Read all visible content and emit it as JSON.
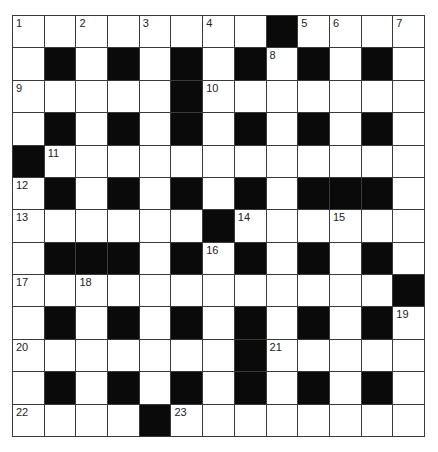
{
  "puzzle": {
    "type": "crossword",
    "rows": 13,
    "cols": 13,
    "colors": {
      "block": "#0a0a0a",
      "cell": "#ffffff",
      "line": "#3a3a3a",
      "number": "#222222"
    },
    "layout": [
      "........#....",
      ".#.#.#.#.#.#.",
      ".....#.......",
      ".#.#.#.#.#.#.",
      "#............",
      ".#.#.#.#.###.",
      "......#......",
      ".###.#.#.#.#.",
      "............#",
      ".#.#.#.#.#.#.",
      ".......#.....",
      ".#.#.#.#.#.#.",
      "....#........"
    ],
    "numbers": [
      {
        "row": 0,
        "col": 0,
        "label": "1"
      },
      {
        "row": 0,
        "col": 2,
        "label": "2"
      },
      {
        "row": 0,
        "col": 4,
        "label": "3"
      },
      {
        "row": 0,
        "col": 6,
        "label": "4"
      },
      {
        "row": 0,
        "col": 9,
        "label": "5"
      },
      {
        "row": 0,
        "col": 10,
        "label": "6"
      },
      {
        "row": 0,
        "col": 12,
        "label": "7"
      },
      {
        "row": 1,
        "col": 8,
        "label": "8"
      },
      {
        "row": 2,
        "col": 0,
        "label": "9"
      },
      {
        "row": 2,
        "col": 6,
        "label": "10"
      },
      {
        "row": 4,
        "col": 1,
        "label": "11"
      },
      {
        "row": 5,
        "col": 0,
        "label": "12"
      },
      {
        "row": 6,
        "col": 0,
        "label": "13"
      },
      {
        "row": 6,
        "col": 7,
        "label": "14"
      },
      {
        "row": 6,
        "col": 10,
        "label": "15"
      },
      {
        "row": 7,
        "col": 6,
        "label": "16"
      },
      {
        "row": 8,
        "col": 0,
        "label": "17"
      },
      {
        "row": 8,
        "col": 2,
        "label": "18"
      },
      {
        "row": 9,
        "col": 12,
        "label": "19"
      },
      {
        "row": 10,
        "col": 0,
        "label": "20"
      },
      {
        "row": 10,
        "col": 8,
        "label": "21"
      },
      {
        "row": 12,
        "col": 0,
        "label": "22"
      },
      {
        "row": 12,
        "col": 5,
        "label": "23"
      }
    ]
  }
}
